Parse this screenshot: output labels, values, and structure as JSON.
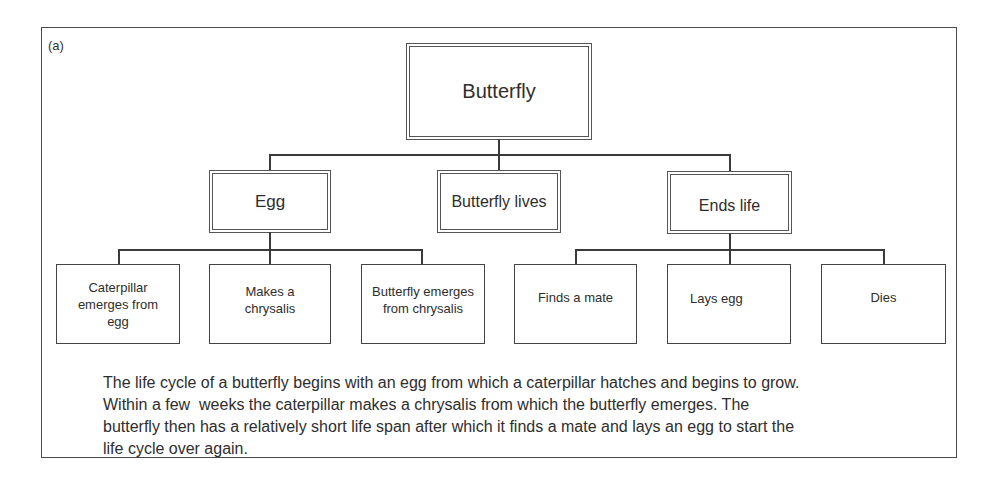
{
  "figure": {
    "panel_label": "(a)",
    "root": {
      "label": "Butterfly"
    },
    "level1": [
      {
        "label": "Egg"
      },
      {
        "label": "Butterfly lives"
      },
      {
        "label": "Ends life"
      }
    ],
    "level2": [
      {
        "label": "Caterpillar emerges from egg",
        "lines": [
          "Caterpillar",
          "emerges from",
          "egg"
        ],
        "parent": "Egg"
      },
      {
        "label": "Makes a chrysalis",
        "lines": [
          "Makes a",
          "chrysalis"
        ],
        "parent": "Egg"
      },
      {
        "label": "Butterfly emerges from chrysalis",
        "lines": [
          "Butterfly emerges",
          "from chrysalis"
        ],
        "parent": "Egg"
      },
      {
        "label": "Finds a mate",
        "lines": [
          "Finds a mate"
        ],
        "parent": "Ends life"
      },
      {
        "label": "Lays egg",
        "lines": [
          "Lays egg"
        ],
        "parent": "Ends life"
      },
      {
        "label": "Dies",
        "lines": [
          "Dies"
        ],
        "parent": "Ends life"
      }
    ],
    "caption_lines": [
      "The life cycle of a butterfly begins with an egg from which a caterpillar hatches and begins to grow.",
      "Within a few  weeks the caterpillar makes a chrysalis from which the butterfly emerges. The",
      "butterfly then has a relatively short life span after which it finds a mate and lays an egg to start the",
      "life cycle over again."
    ]
  }
}
